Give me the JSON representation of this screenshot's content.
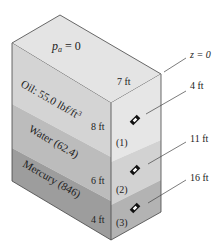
{
  "diagram": {
    "top_label": "p_a = 0",
    "top_label_main": "p",
    "top_label_sub": "a",
    "top_label_rest": " = 0",
    "top_dim": "7 ft",
    "layers": [
      {
        "name": "Oil",
        "label": "Oil: 55.0 lbf/ft",
        "label_sup": "3",
        "thickness": "8 ft",
        "point": "(1)",
        "color_left": "#d4d4d4",
        "color_right": "#e6e6e6"
      },
      {
        "name": "Water",
        "label": "Water (62.4)",
        "thickness": "6 ft",
        "point": "(2)",
        "color_left": "#bcbcbc",
        "color_right": "#d2d2d2"
      },
      {
        "name": "Mercury",
        "label": "Mercury (846)",
        "thickness": "4 ft",
        "point": "(3)",
        "color_left": "#9d9d9d",
        "color_right": "#b3b3b3"
      }
    ],
    "depth_labels": [
      {
        "text": "z = 0"
      },
      {
        "text": "4 ft"
      },
      {
        "text": "11 ft"
      },
      {
        "text": "16 ft"
      }
    ],
    "colors": {
      "top_face": "#e4e4e4",
      "edge": "#444444"
    }
  }
}
